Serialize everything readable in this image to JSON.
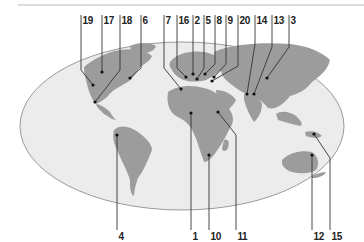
{
  "map": {
    "type": "world-map-locator",
    "projection": "elliptical (Mollweide-like)",
    "colors": {
      "ocean": "#ececec",
      "ocean_border": "#9a9a9a",
      "land": "#9c9c9c",
      "leader_line": "#333333",
      "marker": "#111111",
      "label_text": "#222222",
      "separator": "#bdbdbd"
    },
    "top_labels": [
      "19",
      "17",
      "18",
      "6",
      "7",
      "16",
      "2",
      "5",
      "8",
      "9",
      "20",
      "14",
      "13",
      "3"
    ],
    "bottom_labels": [
      "4",
      "1",
      "10",
      "11",
      "12",
      "15"
    ],
    "markers": [
      {
        "label": "19",
        "region": "Western North America"
      },
      {
        "label": "17",
        "region": "Central North America"
      },
      {
        "label": "18",
        "region": "Mexico / Central America"
      },
      {
        "label": "6",
        "region": "Eastern North America"
      },
      {
        "label": "7",
        "region": "North-west Africa"
      },
      {
        "label": "16",
        "region": "Western Europe"
      },
      {
        "label": "2",
        "region": "Central Europe"
      },
      {
        "label": "5",
        "region": "Southern Europe"
      },
      {
        "label": "8",
        "region": "Eastern Europe"
      },
      {
        "label": "9",
        "region": "Black Sea region"
      },
      {
        "label": "20",
        "region": "Middle East"
      },
      {
        "label": "14",
        "region": "South Asia"
      },
      {
        "label": "13",
        "region": "South Asia (east)"
      },
      {
        "label": "3",
        "region": "East Asia"
      },
      {
        "label": "4",
        "region": "South America"
      },
      {
        "label": "1",
        "region": "West / Central Africa"
      },
      {
        "label": "10",
        "region": "Southern Africa"
      },
      {
        "label": "11",
        "region": "East Africa"
      },
      {
        "label": "12",
        "region": "Australia"
      },
      {
        "label": "15",
        "region": "New Guinea"
      }
    ]
  }
}
